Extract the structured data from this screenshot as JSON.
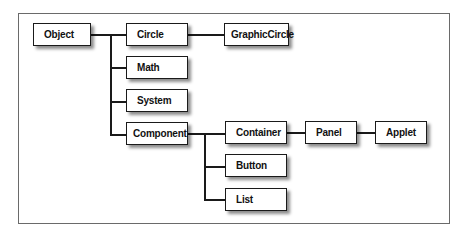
{
  "diagram": {
    "type": "class-hierarchy-tree",
    "nodes": {
      "object": "Object",
      "circle": "Circle",
      "graphic_circle": "GraphicCircle",
      "math": "Math",
      "system": "System",
      "component": "Component",
      "container": "Container",
      "panel": "Panel",
      "applet": "Applet",
      "button": "Button",
      "list": "List"
    },
    "edges": [
      [
        "Object",
        "Circle"
      ],
      [
        "Object",
        "Math"
      ],
      [
        "Object",
        "System"
      ],
      [
        "Object",
        "Component"
      ],
      [
        "Circle",
        "GraphicCircle"
      ],
      [
        "Component",
        "Container"
      ],
      [
        "Component",
        "Button"
      ],
      [
        "Component",
        "List"
      ],
      [
        "Container",
        "Panel"
      ],
      [
        "Panel",
        "Applet"
      ]
    ]
  }
}
